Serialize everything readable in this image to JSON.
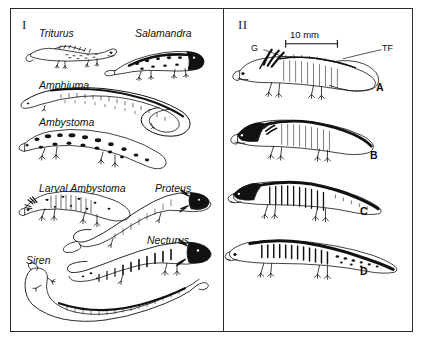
{
  "figure": {
    "panels": [
      {
        "numeral": "I",
        "name": "adult-salamanders",
        "taxa": [
          {
            "label": "Triturus",
            "x": 28,
            "y": 18
          },
          {
            "label": "Salamandra",
            "x": 124,
            "y": 18
          },
          {
            "label": "Amphiuma",
            "x": 28,
            "y": 70
          },
          {
            "label": "Ambystoma",
            "x": 28,
            "y": 107
          },
          {
            "label": "Larval Ambystoma",
            "x": 28,
            "y": 173
          },
          {
            "label": "Proteus",
            "x": 144,
            "y": 173
          },
          {
            "label": "Necturus",
            "x": 136,
            "y": 225
          },
          {
            "label": "Siren",
            "x": 15,
            "y": 245
          }
        ]
      },
      {
        "numeral": "II",
        "name": "larval-stages",
        "scale_bar": {
          "label": "10 mm",
          "x": 62,
          "y": 22,
          "width": 52
        },
        "annotations": [
          {
            "label": "G",
            "x": 30,
            "y": 38,
            "meaning": "gills"
          },
          {
            "label": "TF",
            "x": 160,
            "y": 38,
            "meaning": "tail-fin"
          }
        ],
        "stages": [
          {
            "label": "A",
            "x": 152,
            "y": 72
          },
          {
            "label": "B",
            "x": 146,
            "y": 140
          },
          {
            "label": "C",
            "x": 136,
            "y": 196
          },
          {
            "label": "D",
            "x": 136,
            "y": 256
          }
        ]
      }
    ]
  },
  "colors": {
    "frame": "#2c2c2c",
    "ink": "#111111",
    "background": "#ffffff"
  }
}
